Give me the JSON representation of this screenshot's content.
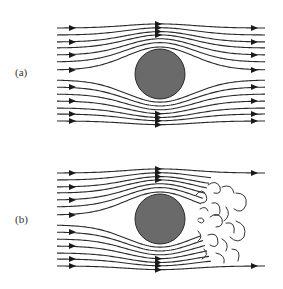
{
  "figure": {
    "panels": [
      {
        "id": "a",
        "label": "(a)",
        "description": "Laminar (potential-like) flow around a cylinder; streamlines rejoin symmetrically behind the body"
      },
      {
        "id": "b",
        "label": "(b)",
        "description": "Separated flow around a cylinder with a turbulent wake of eddies downstream"
      }
    ],
    "colors": {
      "cylinder": "#6a6a6a",
      "streamline": "#2a2a2a",
      "background": "#ffffff"
    }
  }
}
